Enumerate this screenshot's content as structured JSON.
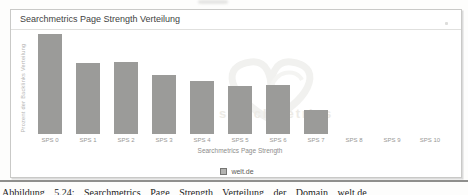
{
  "page": {
    "caption": "Abbildung 5.24: Searchmetrics Page Strength Verteilung der Domain welt.de"
  },
  "chart": {
    "title": "Searchmetrics Page Strength Verteilung",
    "y_axis_label": "Prozent der Backlinks Verteilung",
    "x_axis_label": "Searchmetrics Page Strength",
    "legend": {
      "label": "welt.de",
      "swatch_color": "#b2b2b0"
    },
    "watermark_text": "searchmetrics"
  },
  "chart_data": {
    "type": "bar",
    "title": "Searchmetrics Page Strength Verteilung",
    "categories": [
      "SPS 0",
      "SPS 1",
      "SPS 2",
      "SPS 3",
      "SPS 4",
      "SPS 5",
      "SPS 6",
      "SPS 7",
      "SPS 8",
      "SPS 9",
      "SPS 10"
    ],
    "series": [
      {
        "name": "welt.de",
        "values": [
          100,
          71,
          72,
          59,
          53,
          48,
          49,
          24,
          0,
          0,
          0
        ]
      }
    ],
    "values_note": "y-axis shows no numeric ticks; values are bar heights relative to tallest bar (=100)",
    "xlabel": "Searchmetrics Page Strength",
    "ylabel": "Prozent der Backlinks Verteilung",
    "ylim": [
      0,
      100
    ],
    "grid": false,
    "legend_position": "bottom",
    "bar_color": "#9b9b99"
  },
  "colors": {
    "bar": "#9b9b99",
    "panel_border": "#c9c9c7",
    "title_text": "#3f3f3f",
    "tick_text": "#979795",
    "bottom_rule": "#8f8f8d"
  }
}
